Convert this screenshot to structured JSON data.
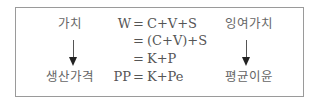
{
  "diagram": {
    "left": {
      "top_label": "가치",
      "bottom_label": "생산가격"
    },
    "right": {
      "top_label": "잉여가치",
      "bottom_label": "평균이윤"
    },
    "equations": [
      {
        "lhs": "W",
        "eq": "=",
        "rhs": "C+V+S"
      },
      {
        "lhs": "",
        "eq": "=",
        "rhs": "(C+V)+S"
      },
      {
        "lhs": "",
        "eq": "=",
        "rhs": "K+P"
      },
      {
        "lhs": "PP",
        "eq": "=",
        "rhs": "K+Pe"
      }
    ]
  }
}
